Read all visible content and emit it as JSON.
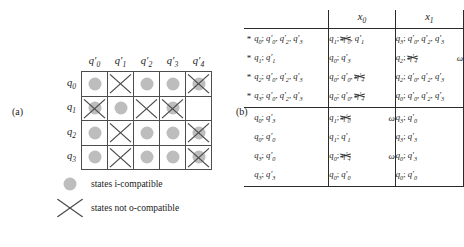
{
  "figure": {
    "panel_a_label": "(a)",
    "panel_b_label": "(b)"
  },
  "compatibility_grid": {
    "column_headers": [
      "q'0",
      "q'1",
      "q'2",
      "q'3",
      "q'4"
    ],
    "row_headers": [
      "q0",
      "q1",
      "q2",
      "q3"
    ],
    "dot_color": "#bdbdbd",
    "x_color": "#4a4a4a",
    "cells": [
      [
        {
          "dot": true,
          "x": false
        },
        {
          "dot": false,
          "x": true
        },
        {
          "dot": true,
          "x": false
        },
        {
          "dot": true,
          "x": false
        },
        {
          "dot": true,
          "x": true
        }
      ],
      [
        {
          "dot": true,
          "x": true
        },
        {
          "dot": true,
          "x": false
        },
        {
          "dot": false,
          "x": true
        },
        {
          "dot": true,
          "x": true
        },
        {
          "dot": false,
          "x": false
        }
      ],
      [
        {
          "dot": true,
          "x": false
        },
        {
          "dot": false,
          "x": true
        },
        {
          "dot": true,
          "x": false
        },
        {
          "dot": true,
          "x": false
        },
        {
          "dot": true,
          "x": true
        }
      ],
      [
        {
          "dot": true,
          "x": false
        },
        {
          "dot": false,
          "x": true
        },
        {
          "dot": true,
          "x": false
        },
        {
          "dot": true,
          "x": false
        },
        {
          "dot": true,
          "x": true
        }
      ]
    ]
  },
  "legend": {
    "items": [
      {
        "key": "dot",
        "label": "states i-compatible"
      },
      {
        "key": "x",
        "label": "states not o-compatible"
      }
    ]
  },
  "flow_table": {
    "headers": {
      "input_x0": "x0",
      "input_x1": "x1"
    },
    "star_symbol": "*",
    "omega_symbol": "ω",
    "rows": [
      {
        "star": true,
        "state": [
          {
            "t": "q0"
          },
          {
            "t": "; "
          },
          {
            "t": "q'0, q'2, q'3"
          }
        ],
        "x0": {
          "parts": [
            {
              "t": "q1; ",
              "strike": false
            },
            {
              "t": "q'0",
              "strike": true
            },
            {
              "t": ", q'1",
              "strike": false
            }
          ],
          "omega": false
        },
        "x1": {
          "parts": [
            {
              "t": "q3; q'0, q'2, q'3",
              "strike": false
            }
          ],
          "omega": false
        }
      },
      {
        "star": true,
        "state": [
          {
            "t": "q1; q'1"
          }
        ],
        "x0": {
          "parts": [
            {
              "t": "q0; q'3",
              "strike": false
            }
          ],
          "omega": false
        },
        "x1": {
          "parts": [
            {
              "t": "q2; ",
              "strike": false
            },
            {
              "t": "q'4",
              "strike": true
            }
          ],
          "omega": true
        }
      },
      {
        "star": true,
        "state": [
          {
            "t": "q2; q'0, q'2, q'3"
          }
        ],
        "x0": {
          "parts": [
            {
              "t": "q0; q'0, ",
              "strike": false
            },
            {
              "t": "q'4",
              "strike": true
            }
          ],
          "omega": false
        },
        "x1": {
          "parts": [
            {
              "t": "q2; q'0, q'2, q'3",
              "strike": false
            }
          ],
          "omega": false
        }
      },
      {
        "star": true,
        "state": [
          {
            "t": "q3; q'0, q'2, q'3"
          }
        ],
        "x0": {
          "parts": [
            {
              "t": "q0; q'0, ",
              "strike": false
            },
            {
              "t": "q'4",
              "strike": true
            }
          ],
          "omega": false
        },
        "x1": {
          "parts": [
            {
              "t": "q0; q'0, q'2, q'3",
              "strike": false
            }
          ],
          "omega": false
        }
      },
      {
        "star": false,
        "state": [
          {
            "t": "q0; q'3"
          }
        ],
        "x0": {
          "parts": [
            {
              "t": "q1; ",
              "strike": false
            },
            {
              "t": "q'0",
              "strike": true
            }
          ],
          "omega": true
        },
        "x1": {
          "parts": [
            {
              "t": "q3; q'0",
              "strike": false
            }
          ],
          "omega": false
        }
      },
      {
        "star": false,
        "state": [
          {
            "t": "q0; q'0"
          }
        ],
        "x0": {
          "parts": [
            {
              "t": "q1; q'1",
              "strike": false
            }
          ],
          "omega": false
        },
        "x1": {
          "parts": [
            {
              "t": "q3; q'3",
              "strike": false
            }
          ],
          "omega": false
        }
      },
      {
        "star": false,
        "state": [
          {
            "t": "q3; q'0"
          }
        ],
        "x0": {
          "parts": [
            {
              "t": "q0; ",
              "strike": false
            },
            {
              "t": "q'4",
              "strike": true
            }
          ],
          "omega": true
        },
        "x1": {
          "parts": [
            {
              "t": "q0; q'3",
              "strike": false
            }
          ],
          "omega": false
        }
      },
      {
        "star": false,
        "state": [
          {
            "t": "q3; q'3"
          }
        ],
        "x0": {
          "parts": [
            {
              "t": "q0; q'0",
              "strike": false
            }
          ],
          "omega": false
        },
        "x1": {
          "parts": [
            {
              "t": "q0; q'0",
              "strike": false
            }
          ],
          "omega": false
        }
      }
    ]
  }
}
